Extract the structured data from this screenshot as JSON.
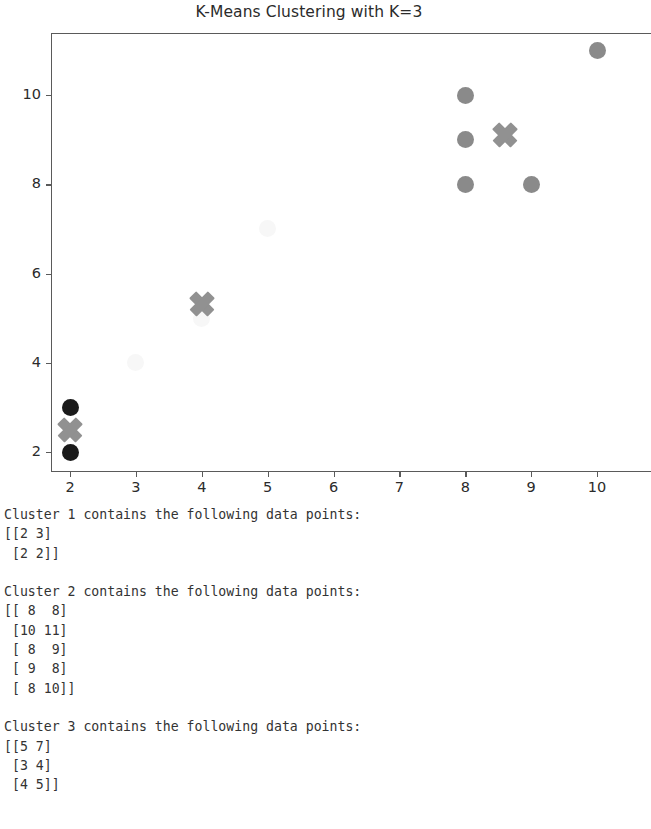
{
  "figure": {
    "title": "K-Means Clustering with K=3",
    "axis": {
      "x_ticks": [
        "2",
        "3",
        "4",
        "5",
        "6",
        "7",
        "8",
        "9",
        "10"
      ],
      "y_ticks": [
        "2",
        "4",
        "6",
        "8",
        "10"
      ]
    }
  },
  "colors": {
    "cluster1_point": "#1a1a1a",
    "cluster2_point": "#8a8a8a",
    "cluster3_point": "#f7f7f7",
    "centroid": "#919191",
    "axis": "#5a5a5a",
    "text": "#333333"
  },
  "chart_data": {
    "type": "scatter",
    "title": "K-Means Clustering with K=3",
    "xlabel": "",
    "ylabel": "",
    "xlim": [
      1.55,
      10.45
    ],
    "ylim": [
      1.55,
      11.45
    ],
    "grid": false,
    "legend": null,
    "xticks": [
      2,
      3,
      4,
      5,
      6,
      7,
      8,
      9,
      10
    ],
    "yticks": [
      2,
      4,
      6,
      8,
      10
    ],
    "series": [
      {
        "name": "Cluster 1",
        "color": "#1a1a1a",
        "marker": "circle",
        "x": [
          2,
          2
        ],
        "y": [
          3,
          2
        ],
        "points": [
          [
            2,
            3
          ],
          [
            2,
            2
          ]
        ]
      },
      {
        "name": "Cluster 2",
        "color": "#8a8a8a",
        "marker": "circle",
        "x": [
          8,
          10,
          8,
          9,
          8
        ],
        "y": [
          8,
          11,
          9,
          8,
          10
        ],
        "points": [
          [
            8,
            8
          ],
          [
            10,
            11
          ],
          [
            8,
            9
          ],
          [
            9,
            8
          ],
          [
            8,
            10
          ]
        ]
      },
      {
        "name": "Cluster 3",
        "color": "#f7f7f7",
        "marker": "circle",
        "x": [
          5,
          3,
          4
        ],
        "y": [
          7,
          4,
          5
        ],
        "points": [
          [
            5,
            7
          ],
          [
            3,
            4
          ],
          [
            4,
            5
          ]
        ]
      },
      {
        "name": "Centroids",
        "color": "#919191",
        "marker": "X",
        "x": [
          2,
          8.6,
          4
        ],
        "y": [
          2.5,
          9.1,
          5.33
        ],
        "points": [
          [
            2,
            2.5
          ],
          [
            8.6,
            9.1
          ],
          [
            4,
            5.33
          ]
        ]
      }
    ]
  },
  "console": {
    "blocks": [
      {
        "header": "Cluster 1 contains the following data points:",
        "body": "[[2 3]\n [2 2]]"
      },
      {
        "header": "Cluster 2 contains the following data points:",
        "body": "[[ 8  8]\n [10 11]\n [ 8  9]\n [ 9  8]\n [ 8 10]]"
      },
      {
        "header": "Cluster 3 contains the following data points:",
        "body": "[[5 7]\n [3 4]\n [4 5]]"
      }
    ]
  }
}
